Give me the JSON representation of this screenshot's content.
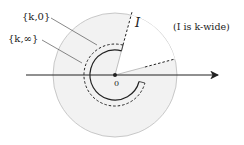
{
  "diagram": {
    "labels": {
      "k0": "{k,0}",
      "kinf": "{k,∞}",
      "interval": "I",
      "note": "(I is k-wide)",
      "origin": "0"
    },
    "geometry": {
      "center": [
        115,
        75
      ],
      "outer_radius": 62,
      "solid_arc_radius": 25,
      "dashed_arc_radius": 31
    },
    "colors": {
      "shade": "#f2f2f2",
      "outer_stroke": "#bbbbbb",
      "ink": "#222222"
    }
  }
}
